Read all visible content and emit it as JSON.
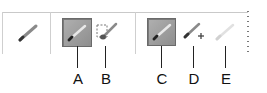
{
  "toolbar": {
    "tools": [
      {
        "id": "tool-preset",
        "icon": "pencil-icon",
        "state": "normal"
      },
      {
        "id": "A",
        "icon": "pencil-icon",
        "state": "pressed"
      },
      {
        "id": "B",
        "icon": "brush-selection-icon",
        "state": "normal"
      },
      {
        "id": "C",
        "icon": "pencil-icon",
        "state": "pressed"
      },
      {
        "id": "D",
        "icon": "pencil-plus-icon",
        "state": "normal"
      },
      {
        "id": "E",
        "icon": "pencil-icon",
        "state": "disabled"
      }
    ],
    "colors": {
      "pressed_bg": "#9e9e9e",
      "border": "#6a6a6a",
      "divider": "#cfcfcf"
    }
  },
  "callouts": {
    "A": "A",
    "B": "B",
    "C": "C",
    "D": "D",
    "E": "E"
  }
}
